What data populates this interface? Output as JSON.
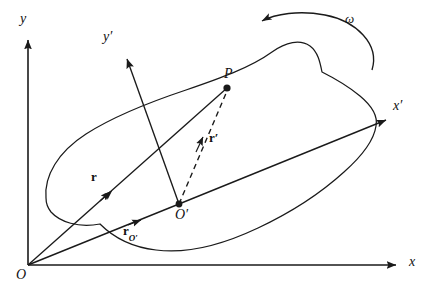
{
  "figure": {
    "stroke_color": "#1a1a1a",
    "background_color": "#ffffff"
  },
  "labels": {
    "axis_y": "y",
    "axis_x": "x",
    "axis_y_prime": "y′",
    "axis_x_prime": "x′",
    "origin_fixed": "O",
    "origin_moving": "O′",
    "point_p": "P",
    "vector_r": "r",
    "vector_r_prime": "r′",
    "vector_r_origin_base": "r",
    "vector_r_origin_sub": "O′",
    "angular_velocity": "ω"
  },
  "geometry": {
    "fixed_origin": [
      28,
      265
    ],
    "y_axis_tip": [
      28,
      36
    ],
    "x_axis_tip": [
      400,
      265
    ],
    "moving_origin": [
      179,
      204
    ],
    "y_prime_tip": [
      124,
      54
    ],
    "x_prime_tip": [
      391,
      117
    ],
    "point_p": [
      227,
      88
    ],
    "body_outline": "M 46,198 C 44,176 58,152 86,134 C 114,116 150,102 186,90 C 218,79 250,68 272,52 C 286,42 300,39 310,46 C 318,52 320,62 322,72 C 334,78 348,86 360,96 C 372,106 378,116 376,126 C 374,140 362,156 344,172 C 322,192 292,212 258,228 C 222,245 186,254 156,250 C 130,247 112,236 100,224 C 78,228 60,222 51,212 C 47,207 46,203 46,198 Z",
    "omega_arc": "M 372,70 C 378,44 352,22 322,16 C 296,11 272,14 258,22",
    "omega_arrow_tip": [
      256,
      22
    ],
    "r_arrow_tip": [
      112,
      192
    ],
    "r_origin_arrow_tip": [
      143,
      224
    ],
    "r_prime_arrow_tip": [
      205,
      136
    ]
  },
  "label_positions": {
    "axis_y": [
      20,
      14
    ],
    "axis_x": [
      409,
      256
    ],
    "axis_y_prime": [
      105,
      32
    ],
    "axis_x_prime": [
      394,
      100
    ],
    "origin_fixed": [
      18,
      268
    ],
    "origin_moving": [
      176,
      207
    ],
    "point_p": [
      224,
      68
    ],
    "vector_r": [
      92,
      170
    ],
    "vector_r_prime": [
      208,
      130
    ],
    "vector_r_origin": [
      124,
      225
    ],
    "angular_velocity": [
      346,
      12
    ]
  }
}
